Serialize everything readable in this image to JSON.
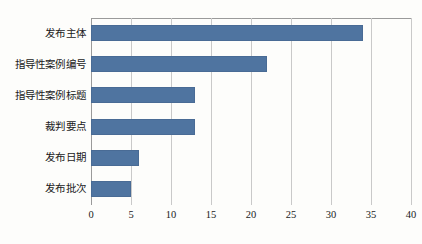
{
  "chart_data": {
    "type": "bar",
    "orientation": "horizontal",
    "title": "",
    "xlabel": "",
    "ylabel": "",
    "categories": [
      "发布主体",
      "指导性案例编号",
      "指导性案例标题",
      "裁判要点",
      "发布日期",
      "发布批次"
    ],
    "values": [
      34,
      22,
      13,
      13,
      6,
      5
    ],
    "xlim": [
      0,
      40
    ],
    "xticks": [
      0,
      5,
      10,
      15,
      20,
      25,
      30,
      35,
      40
    ],
    "xtick_labels": [
      "0",
      "5",
      "10",
      "15",
      "20",
      "25",
      "30",
      "35",
      "40"
    ],
    "grid": true,
    "grid_axis": "x",
    "legend": false,
    "legend_position": "none",
    "bar_color": "#4f74a0",
    "gridline_color": "#c9c9c9",
    "axis_color": "#9a9a9a",
    "background_color": "#fdfdfb",
    "series": [
      {
        "name": "计数",
        "values": [
          34,
          22,
          13,
          13,
          6,
          5
        ]
      }
    ]
  }
}
